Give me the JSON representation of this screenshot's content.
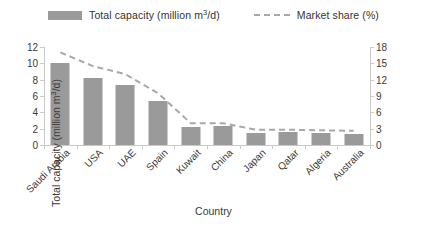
{
  "legend": {
    "items": [
      {
        "label_prefix": "Total capacity (million m",
        "label_sup": "3",
        "label_suffix": "/d)",
        "marker": "bar-swatch",
        "color": "#9a9a9a"
      },
      {
        "label_prefix": "Market share (%)",
        "label_sup": "",
        "label_suffix": "",
        "marker": "dashed-line-swatch",
        "color": "#a8a8a8"
      }
    ]
  },
  "chart_data": {
    "type": "bar",
    "title": "",
    "categories": [
      "Saudi Arabia",
      "USA",
      "UAE",
      "Spain",
      "Kuwait",
      "China",
      "Japan",
      "Qatar",
      "Algeria",
      "Australia"
    ],
    "series": [
      {
        "name": "Total capacity (million m3/d)",
        "type": "bar",
        "axis": "left",
        "color": "#9a9a9a",
        "values": [
          10.0,
          8.2,
          7.4,
          5.4,
          2.2,
          2.3,
          1.5,
          1.6,
          1.5,
          1.4
        ]
      },
      {
        "name": "Market share (%)",
        "type": "line",
        "axis": "right",
        "color": "#a8a8a8",
        "style": "dashed",
        "values": [
          17.0,
          14.5,
          13.0,
          9.5,
          4.0,
          4.0,
          2.8,
          2.8,
          2.7,
          2.6
        ]
      }
    ],
    "xlabel": "Country",
    "ylabel_left_prefix": "Total capacity (million m",
    "ylabel_left_sup": "3",
    "ylabel_left_suffix": "/d)",
    "ylabel_right": "Market share (%)",
    "ylim_left": [
      0,
      12
    ],
    "yticks_left": [
      "0",
      "2",
      "4",
      "6",
      "8",
      "10",
      "12"
    ],
    "ylim_right": [
      0,
      18
    ],
    "yticks_right": [
      "0",
      "3",
      "6",
      "9",
      "12",
      "15",
      "18"
    ],
    "grid": false,
    "legend_position": "top-center"
  }
}
